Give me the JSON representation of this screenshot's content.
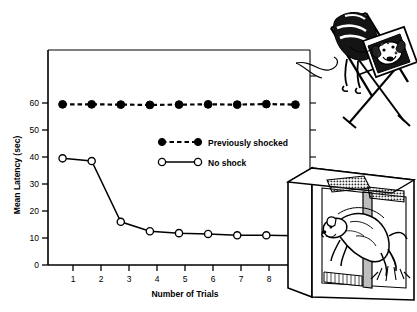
{
  "chart_data": {
    "type": "line",
    "title": "",
    "xlabel": "Number of Trials",
    "ylabel": "Mean Latency (sec)",
    "x": [
      1,
      2,
      3,
      4,
      5,
      6,
      7,
      8,
      9
    ],
    "xticklabels": [
      "1",
      "2",
      "3",
      "4",
      "5",
      "6",
      "7",
      "8",
      "9"
    ],
    "yticklabels": [
      "0",
      "10",
      "20",
      "30",
      "40",
      "50",
      "60"
    ],
    "yticks": [
      0,
      10,
      20,
      30,
      40,
      50,
      60
    ],
    "xlim": [
      0.5,
      9.5
    ],
    "ylim": [
      0,
      68
    ],
    "grid": false,
    "legend_position": "center",
    "series": [
      {
        "name": "Previously shocked",
        "marker": "filled-circle",
        "linestyle": "dashed",
        "color": "#000000",
        "values": [
          59.5,
          59.5,
          59.4,
          59.3,
          59.4,
          59.5,
          59.4,
          59.6,
          59.4
        ]
      },
      {
        "name": "No shock",
        "marker": "open-circle",
        "linestyle": "solid",
        "color": "#000000",
        "values": [
          39.5,
          38.5,
          16.0,
          12.5,
          11.8,
          11.5,
          11.0,
          11.0,
          10.8
        ]
      }
    ]
  },
  "legend": {
    "entries": [
      {
        "label": "Previously shocked",
        "marker": "filled-circle",
        "linestyle": "dashed"
      },
      {
        "label": "No shock",
        "marker": "open-circle",
        "linestyle": "solid"
      }
    ]
  },
  "illustrations": [
    {
      "name": "dog-in-restraining-hammock",
      "caption": "Dog suspended in a restraining hammock apparatus"
    },
    {
      "name": "dog-jumping-shuttle-box-barrier",
      "caption": "Dog jumping the barrier in a two-compartment shuttle box with grid floor"
    }
  ],
  "colors": {
    "ink": "#000000",
    "background": "#ffffff",
    "shading": "#6e6e6e"
  }
}
